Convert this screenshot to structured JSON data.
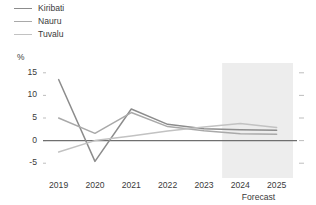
{
  "chart_data": {
    "type": "line",
    "title": "",
    "subtitle": "",
    "xlabel": "",
    "ylabel": "%",
    "unit_label": "%",
    "x": [
      2019,
      2020,
      2021,
      2022,
      2023,
      2024,
      2025
    ],
    "categories": [
      "2019",
      "2020",
      "2021",
      "2022",
      "2023",
      "2024",
      "2025"
    ],
    "ylim": [
      -6.5,
      16.5
    ],
    "yticks": [
      15,
      10,
      5,
      0,
      -5
    ],
    "ytick_labels": [
      "15",
      "10",
      "5",
      "0",
      "-5"
    ],
    "grid": false,
    "zero_line": 0,
    "legend_position": "top-left",
    "series": [
      {
        "name": "Kiribati",
        "color": "#8c8c8c",
        "values": [
          13.5,
          -4.6,
          7.0,
          3.6,
          2.6,
          2.4,
          2.3
        ]
      },
      {
        "name": "Nauru",
        "color": "#a9a9a9",
        "values": [
          5.0,
          1.6,
          6.2,
          3.1,
          2.2,
          1.5,
          1.4
        ]
      },
      {
        "name": "Tuvalu",
        "color": "#c2c2c2",
        "values": [
          -2.5,
          0.0,
          1.0,
          2.1,
          3.0,
          3.8,
          2.9
        ]
      }
    ],
    "annotations": [
      {
        "name": "forecast-band",
        "label": "Forecast",
        "x_start": 2023.5,
        "x_end": 2025.45,
        "color": "#ededed"
      }
    ]
  },
  "legend": {
    "items": [
      {
        "label": "Kiribati",
        "color": "#8c8c8c"
      },
      {
        "label": "Nauru",
        "color": "#a9a9a9"
      },
      {
        "label": "Tuvalu",
        "color": "#c2c2c2"
      }
    ]
  },
  "axes": {
    "unit": "%",
    "y_labels": [
      "15",
      "10",
      "5",
      "0",
      "-5"
    ],
    "x_labels": [
      "2019",
      "2020",
      "2021",
      "2022",
      "2023",
      "2024",
      "2025"
    ],
    "forecast_caption": "Forecast"
  },
  "colors": {
    "background": "#ffffff",
    "axis_text": "#3a3a3a",
    "tick": "#b5b5b5",
    "zero_line": "#6f6f6f",
    "forecast_band": "#ededed"
  }
}
